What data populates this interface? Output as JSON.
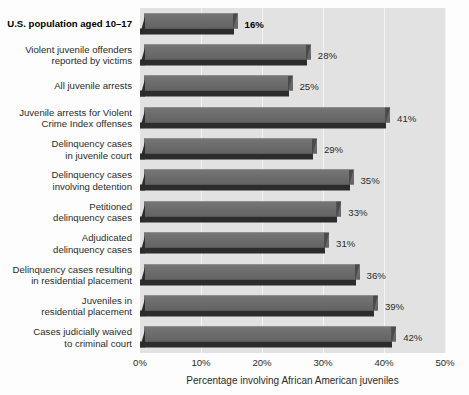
{
  "chart_data": {
    "type": "bar",
    "orientation": "horizontal",
    "title": "",
    "xlabel": "Percentage involving African American juveniles",
    "ylabel": "",
    "xlim": [
      0,
      50
    ],
    "xticks": [
      "0%",
      "10%",
      "20%",
      "30%",
      "40%",
      "50%"
    ],
    "xtick_values": [
      0,
      10,
      20,
      30,
      40,
      50
    ],
    "grid": true,
    "legend": null,
    "categories": [
      "U.S. population aged 10–17",
      "Violent juvenile offenders\nreported by victims",
      "All juvenile arrests",
      "Juvenile arrests for Violent\nCrime Index offenses",
      "Delinquency cases\nin juvenile court",
      "Delinquency cases\ninvolving detention",
      "Petitioned\ndelinquency cases",
      "Adjudicated\ndelinquency cases",
      "Delinquency cases resulting\nin residential placement",
      "Juveniles in\nresidential placement",
      "Cases judicially waived\nto criminal court"
    ],
    "values": [
      16,
      28,
      25,
      41,
      29,
      35,
      33,
      31,
      36,
      39,
      42
    ],
    "value_labels": [
      "16%",
      "28%",
      "25%",
      "41%",
      "29%",
      "35%",
      "33%",
      "31%",
      "36%",
      "39%",
      "42%"
    ],
    "emphasized_index": 0,
    "colors": {
      "bar_face": "#6d6d6d",
      "bar_shadow": "#2c2c2c",
      "panel_background": "#e2e2e2",
      "gridline": "#f4f4f4",
      "text": "#2b2b2b",
      "figure_background": "#fdfdfd"
    }
  }
}
